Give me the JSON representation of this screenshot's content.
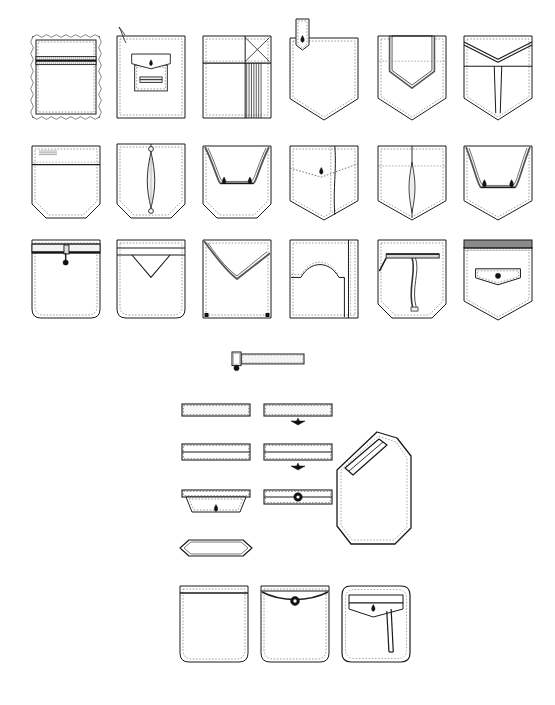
{
  "sheet": {
    "title": "Pocket Construction Technical Flats",
    "background_color": "#ffffff",
    "line_color": "#1a1a1a",
    "fill_color": "#ffffff",
    "shadow_color": "#555555",
    "dash_color": "#777777",
    "width": 555,
    "height": 705
  },
  "sections": [
    {
      "id": "patch-pocket-grid",
      "name": "Patch Pocket Grid",
      "rows": 3,
      "columns": 6
    },
    {
      "id": "welt-pocket-group",
      "name": "Welt and Slash Pocket Group"
    },
    {
      "id": "rounded-pocket-row",
      "name": "Rounded Patch Pocket Row"
    }
  ],
  "figures": [
    {
      "id": "p01",
      "name": "square-patch-pocket-with-horizontal-zipper",
      "row": 1,
      "col": 1,
      "x": 32,
      "y": 36,
      "w": 68,
      "h": 82,
      "shape": "square",
      "features": [
        "zipper",
        "topstitch",
        "raw-edge"
      ]
    },
    {
      "id": "p02",
      "name": "square-patch-pocket-with-buttoned-mini-flap",
      "row": 1,
      "col": 2,
      "x": 117,
      "y": 36,
      "w": 68,
      "h": 82,
      "shape": "square",
      "features": [
        "flap",
        "button",
        "inner-welt",
        "hanging-thread"
      ]
    },
    {
      "id": "p03",
      "name": "square-patch-pocket-with-pleats-and-x-stitch",
      "row": 1,
      "col": 3,
      "x": 203,
      "y": 36,
      "w": 68,
      "h": 82,
      "shape": "square",
      "features": [
        "band",
        "pleats",
        "x-stitch"
      ]
    },
    {
      "id": "p04",
      "name": "pointed-patch-pocket-with-button-tab",
      "row": 1,
      "col": 4,
      "x": 290,
      "y": 28,
      "w": 68,
      "h": 92,
      "shape": "pointed",
      "features": [
        "tab",
        "button"
      ]
    },
    {
      "id": "p05",
      "name": "pointed-patch-pocket-with-inner-pointed-pocket",
      "row": 1,
      "col": 5,
      "x": 378,
      "y": 36,
      "w": 68,
      "h": 84,
      "shape": "pointed",
      "features": [
        "inset-pocket",
        "dashed-line"
      ]
    },
    {
      "id": "p06",
      "name": "pointed-patch-pocket-with-chevron-yoke-and-center-seam",
      "row": 1,
      "col": 6,
      "x": 464,
      "y": 36,
      "w": 68,
      "h": 84,
      "shape": "pointed",
      "features": [
        "chevron-yoke",
        "center-seam"
      ]
    },
    {
      "id": "p07",
      "name": "cut-corner-patch-pocket-with-band",
      "row": 2,
      "col": 1,
      "x": 32,
      "y": 146,
      "w": 68,
      "h": 72,
      "shape": "cut-corner",
      "features": [
        "band",
        "label-stitch"
      ]
    },
    {
      "id": "p08",
      "name": "cut-corner-patch-pocket-with-center-gusset",
      "row": 2,
      "col": 2,
      "x": 117,
      "y": 144,
      "w": 68,
      "h": 74,
      "shape": "cut-corner",
      "features": [
        "center-gusset",
        "bartack"
      ]
    },
    {
      "id": "p09",
      "name": "cut-corner-patch-pocket-with-curved-inset-and-darts",
      "row": 2,
      "col": 3,
      "x": 203,
      "y": 146,
      "w": 68,
      "h": 72,
      "shape": "cut-corner",
      "features": [
        "curved-inset",
        "darts"
      ]
    },
    {
      "id": "p10",
      "name": "pointed-patch-pocket-with-diagonal-yoke-and-button",
      "row": 2,
      "col": 4,
      "x": 290,
      "y": 146,
      "w": 68,
      "h": 74,
      "shape": "pointed",
      "features": [
        "diagonal-yoke",
        "button",
        "side-seam"
      ]
    },
    {
      "id": "p11",
      "name": "pointed-patch-pocket-with-center-gusset",
      "row": 2,
      "col": 5,
      "x": 378,
      "y": 146,
      "w": 68,
      "h": 74,
      "shape": "pointed",
      "features": [
        "center-gusset",
        "dashed-line"
      ]
    },
    {
      "id": "p12",
      "name": "pointed-patch-pocket-with-curved-inset-and-darts",
      "row": 2,
      "col": 6,
      "x": 464,
      "y": 146,
      "w": 68,
      "h": 74,
      "shape": "pointed",
      "features": [
        "curved-inset",
        "darts"
      ]
    },
    {
      "id": "p13",
      "name": "round-corner-patch-pocket-with-zipper",
      "row": 3,
      "col": 1,
      "x": 32,
      "y": 240,
      "w": 68,
      "h": 78,
      "shape": "round-corner",
      "features": [
        "zipper",
        "band"
      ]
    },
    {
      "id": "p14",
      "name": "round-corner-patch-pocket-with-v-notch-band",
      "row": 3,
      "col": 2,
      "x": 117,
      "y": 240,
      "w": 68,
      "h": 78,
      "shape": "round-corner",
      "features": [
        "band",
        "v-notch"
      ]
    },
    {
      "id": "p15",
      "name": "square-patch-pocket-with-v-envelope-flap",
      "row": 3,
      "col": 3,
      "x": 203,
      "y": 240,
      "w": 68,
      "h": 78,
      "shape": "square",
      "features": [
        "envelope-flap",
        "bartack"
      ]
    },
    {
      "id": "p16",
      "name": "square-patch-pocket-with-arched-inset",
      "row": 3,
      "col": 4,
      "x": 290,
      "y": 240,
      "w": 68,
      "h": 78,
      "shape": "square",
      "features": [
        "arched-inset",
        "side-panel"
      ]
    },
    {
      "id": "p17",
      "name": "pointed-patch-pocket-with-pen-slot-and-zipper",
      "row": 3,
      "col": 5,
      "x": 378,
      "y": 240,
      "w": 68,
      "h": 78,
      "shape": "cut-corner",
      "features": [
        "pen-slot",
        "zipper",
        "diagonal-stitch"
      ]
    },
    {
      "id": "p18",
      "name": "pointed-patch-pocket-with-button-flap-and-band",
      "row": 3,
      "col": 6,
      "x": 464,
      "y": 240,
      "w": 68,
      "h": 80,
      "shape": "pointed",
      "features": [
        "band",
        "button-flap"
      ]
    },
    {
      "id": "w01",
      "name": "single-welt-pocket-with-button-tab",
      "group": "welt",
      "x": 232,
      "y": 354,
      "w": 72,
      "h": 16,
      "kind": "welt-button-tab"
    },
    {
      "id": "w02",
      "name": "single-welt-pocket-plain",
      "group": "welt",
      "x": 182,
      "y": 404,
      "w": 68,
      "h": 12,
      "kind": "single-welt"
    },
    {
      "id": "w03",
      "name": "single-welt-pocket-with-center-dart",
      "group": "welt",
      "x": 264,
      "y": 404,
      "w": 68,
      "h": 12,
      "kind": "single-welt-dart"
    },
    {
      "id": "w04",
      "name": "double-welt-pocket-plain",
      "group": "welt",
      "x": 182,
      "y": 444,
      "w": 68,
      "h": 16,
      "kind": "double-welt"
    },
    {
      "id": "w05",
      "name": "double-welt-pocket-with-center-dart",
      "group": "welt",
      "x": 264,
      "y": 444,
      "w": 68,
      "h": 16,
      "kind": "double-welt-dart"
    },
    {
      "id": "w06",
      "name": "welt-pocket-with-pointed-button-flap",
      "group": "welt",
      "x": 182,
      "y": 490,
      "w": 68,
      "h": 30,
      "kind": "welt-pointed-flap"
    },
    {
      "id": "w07",
      "name": "double-welt-pocket-with-center-button",
      "group": "welt",
      "x": 264,
      "y": 490,
      "w": 68,
      "h": 22,
      "kind": "double-welt-button"
    },
    {
      "id": "w08",
      "name": "pointed-end-welt-pocket",
      "group": "welt",
      "x": 180,
      "y": 540,
      "w": 72,
      "h": 16,
      "kind": "pointed-welt"
    },
    {
      "id": "w09",
      "name": "angled-hip-pocket-with-slash-welt",
      "group": "welt",
      "x": 333,
      "y": 432,
      "w": 78,
      "h": 112,
      "kind": "angled-hip-pocket"
    },
    {
      "id": "b01",
      "name": "rounded-patch-pocket-with-band",
      "group": "bottom",
      "x": 180,
      "y": 586,
      "w": 68,
      "h": 76,
      "kind": "rounded-band"
    },
    {
      "id": "b02",
      "name": "rounded-patch-pocket-with-curved-band-and-button",
      "group": "bottom",
      "x": 261,
      "y": 586,
      "w": 68,
      "h": 76,
      "kind": "rounded-curved-band-button"
    },
    {
      "id": "b03",
      "name": "rounded-square-pocket-with-flap-and-pen-slot",
      "group": "bottom",
      "x": 342,
      "y": 586,
      "w": 68,
      "h": 76,
      "kind": "rounded-flap-pen"
    }
  ]
}
